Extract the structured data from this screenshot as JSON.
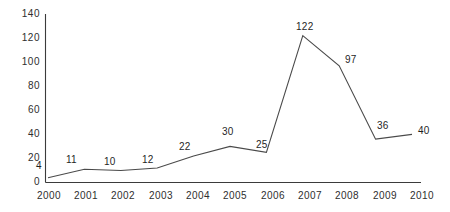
{
  "chart_data": {
    "type": "line",
    "title": "",
    "subtitle": "",
    "xlabel": "",
    "ylabel": "",
    "categories": [
      "2000",
      "2001",
      "2002",
      "2003",
      "2004",
      "2005",
      "2006",
      "2007",
      "2008",
      "2009",
      "2010"
    ],
    "values": [
      4,
      11,
      10,
      12,
      22,
      30,
      25,
      122,
      97,
      36,
      40
    ],
    "series": [
      {
        "name": "",
        "values": [
          4,
          11,
          10,
          12,
          22,
          30,
          25,
          122,
          97,
          36,
          40
        ]
      }
    ],
    "point_labels": [
      "4",
      "11",
      "10",
      "12",
      "22",
      "30",
      "25",
      "122",
      "97",
      "36",
      "40"
    ],
    "ylim": [
      0,
      140
    ],
    "ytick_values": [
      0,
      20,
      40,
      60,
      80,
      100,
      120,
      140
    ],
    "ytick_labels": [
      "0",
      "20",
      "40",
      "60",
      "80",
      "100",
      "120",
      "140"
    ],
    "xtick_labels": [
      "2000",
      "2001",
      "2002",
      "2003",
      "2004",
      "2005",
      "2006",
      "2007",
      "2008",
      "2009",
      "2010"
    ],
    "grid": false,
    "legend": null,
    "legend_position": "none",
    "line_color": "#4a4a4a",
    "axis_color": "#3b3b3b",
    "text_color": "#2e2e2e",
    "background_color": "#ffffff",
    "markers": false
  },
  "labels": {
    "y0": "0",
    "y20": "20",
    "y40": "40",
    "y60": "60",
    "y80": "80",
    "y100": "100",
    "y120": "120",
    "y140": "140",
    "x0": "2000",
    "x1": "2001",
    "x2": "2002",
    "x3": "2003",
    "x4": "2004",
    "x5": "2005",
    "x6": "2006",
    "x7": "2007",
    "x8": "2008",
    "x9": "2009",
    "x10": "2010",
    "p0": "4",
    "p1": "11",
    "p2": "10",
    "p3": "12",
    "p4": "22",
    "p5": "30",
    "p6": "25",
    "p7": "122",
    "p8": "97",
    "p9": "36",
    "p10": "40"
  }
}
